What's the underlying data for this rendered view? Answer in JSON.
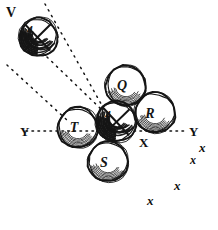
{
  "figure": {
    "kind": "hand-drawn-billiards-diagram",
    "width": 218,
    "height": 230,
    "background_color": "#ffffff",
    "ink_color": "#151515"
  },
  "balls": [
    {
      "id": "cue-ball-v",
      "label": "4",
      "cx": 38,
      "cy": 37,
      "r": 19,
      "has_cross": true,
      "shaded": true,
      "label_dx": -8,
      "label_dy": -4,
      "label_size": 11
    },
    {
      "id": "ball-q",
      "label": "Q",
      "cx": 126,
      "cy": 86,
      "r": 20,
      "has_cross": false,
      "shaded": false,
      "label_dx": -4,
      "label_dy": 4,
      "label_size": 14
    },
    {
      "id": "ball-r",
      "label": "R",
      "cx": 155,
      "cy": 113,
      "r": 20,
      "has_cross": false,
      "shaded": false,
      "label_dx": -5,
      "label_dy": 5,
      "label_size": 14
    },
    {
      "id": "object-ball-center",
      "label": "4",
      "cx": 116,
      "cy": 122,
      "r": 20,
      "has_cross": true,
      "shaded": true,
      "label_dx": -8,
      "label_dy": -4,
      "label_size": 11
    },
    {
      "id": "ball-t",
      "label": "T",
      "cx": 78,
      "cy": 128,
      "r": 20,
      "has_cross": false,
      "shaded": false,
      "label_dx": -4,
      "label_dy": 4,
      "label_size": 14
    },
    {
      "id": "ball-s",
      "label": "S",
      "cx": 108,
      "cy": 162,
      "r": 20,
      "has_cross": false,
      "shaded": false,
      "label_dx": -4,
      "label_dy": 5,
      "label_size": 14
    }
  ],
  "axis": {
    "line": {
      "x1": 26,
      "y1": 131,
      "x2": 184,
      "y2": 131
    },
    "left_label": {
      "text": "Y",
      "x": 20,
      "y": 136,
      "size": 13
    },
    "right_label": {
      "text": "Y",
      "x": 189,
      "y": 136,
      "size": 13
    },
    "intersection_label": {
      "text": "X",
      "x": 139,
      "y": 147,
      "size": 13
    }
  },
  "trajectories": [
    {
      "id": "path-upper",
      "x1": 45,
      "y1": 4,
      "x2": 104,
      "y2": 109
    },
    {
      "id": "path-mid",
      "x1": 47,
      "y1": 57,
      "x2": 104,
      "y2": 112
    },
    {
      "id": "path-lower",
      "x1": 7,
      "y1": 65,
      "x2": 68,
      "y2": 121
    }
  ],
  "marks": [
    {
      "text": "x",
      "x": 199,
      "y": 152,
      "size": 13
    },
    {
      "text": "x",
      "x": 174,
      "y": 190,
      "size": 13
    },
    {
      "text": "x",
      "x": 147,
      "y": 205,
      "size": 13
    },
    {
      "text": "x",
      "x": 190,
      "y": 164,
      "size": 12
    }
  ],
  "corner_label": {
    "text": "V",
    "x": 6,
    "y": 17,
    "size": 14
  }
}
